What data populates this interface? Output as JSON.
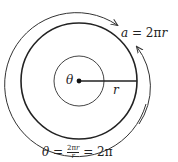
{
  "diagram": {
    "center_label": "θ",
    "radius_label": "r",
    "arc_label": "a = 2πr",
    "angle_equation": "θ = 2πr/r = 2π",
    "angle_equation_display": "θ = ²πr = 2π",
    "colors": {
      "stroke": "#222222",
      "background": "#ffffff"
    }
  }
}
